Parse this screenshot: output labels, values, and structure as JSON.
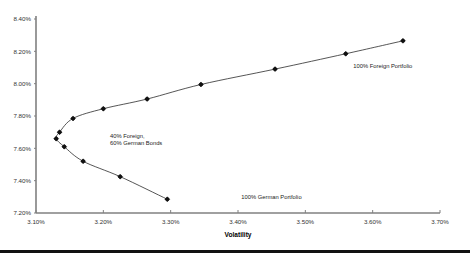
{
  "chart_data": {
    "type": "scatter",
    "title": "",
    "xlabel": "Volatility",
    "ylabel": "",
    "xlim": [
      3.1,
      3.7
    ],
    "ylim": [
      7.2,
      8.4
    ],
    "grid": false,
    "legend": "none",
    "x_ticks": [
      "3.10%",
      "3.20%",
      "3.30%",
      "3.40%",
      "3.50%",
      "3.60%",
      "3.70%"
    ],
    "x_tick_values": [
      3.1,
      3.2,
      3.3,
      3.4,
      3.5,
      3.6,
      3.7
    ],
    "y_ticks": [
      "7.20%",
      "7.40%",
      "7.60%",
      "7.80%",
      "8.00%",
      "8.20%",
      "8.40%"
    ],
    "y_tick_values": [
      7.2,
      7.4,
      7.6,
      7.8,
      8.0,
      8.2,
      8.4
    ],
    "series": [
      {
        "name": "Efficient frontier",
        "x": [
          3.295,
          3.225,
          3.17,
          3.142,
          3.13,
          3.135,
          3.155,
          3.2,
          3.265,
          3.345,
          3.455,
          3.56,
          3.645
        ],
        "y": [
          7.285,
          7.425,
          7.52,
          7.61,
          7.66,
          7.7,
          7.785,
          7.845,
          7.905,
          7.995,
          8.09,
          8.185,
          8.265
        ]
      }
    ],
    "annotations": [
      {
        "text_line1": "40% Foreign,",
        "text_line2": "60% German Bonds",
        "x": 3.21,
        "y": 7.665
      },
      {
        "text": "100% German Portfolio",
        "x": 3.405,
        "y": 7.285
      },
      {
        "text": "100% Foreign Portfolio",
        "x": 3.615,
        "y": 8.095
      }
    ],
    "colors": {
      "line": "#2b2b2b",
      "marker": "#111111",
      "axis": "#808080",
      "text": "#222222"
    }
  }
}
